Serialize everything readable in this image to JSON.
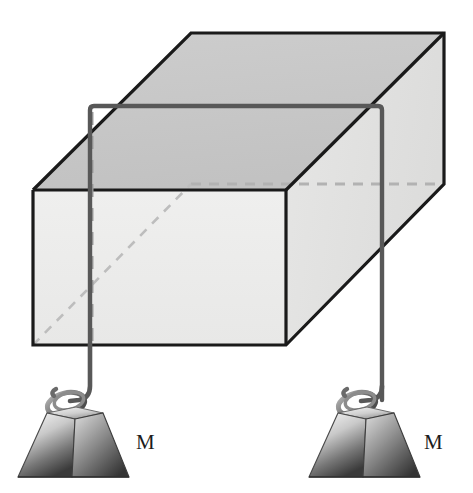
{
  "figure": {
    "type": "physics-free-body-diagram",
    "canvas": {
      "width": 473,
      "height": 493
    },
    "background_color": "#ffffff"
  },
  "labels": {
    "mass_left": "M",
    "mass_right": "M"
  },
  "colors": {
    "outline": "#1a1a1a",
    "top_face": "#c9c9c9",
    "front_face": "#ececeb",
    "side_face": "#e3e3e2",
    "hidden_edge": "#b0b0b0",
    "cord": "#5a5a5a",
    "weight_light": "#f2f2f2",
    "weight_dark": "#3a3a3a",
    "label_text": "#1c1c1c"
  },
  "geometry": {
    "box": {
      "front_face": [
        [
          33,
          190
        ],
        [
          286,
          190
        ],
        [
          286,
          345
        ],
        [
          33,
          345
        ]
      ],
      "back_face": [
        [
          191,
          33
        ],
        [
          444,
          33
        ],
        [
          444,
          184
        ],
        [
          191,
          184
        ]
      ],
      "depth_offset": [
        158,
        -157
      ]
    },
    "cord": {
      "left_vertical_x": 90,
      "right_vertical_x": 382,
      "horizontal_y": 106,
      "stroke_width": 4.2
    },
    "weights": [
      {
        "name": "mass-left",
        "center_x": 75,
        "top_y": 412,
        "bottom_y": 476
      },
      {
        "name": "mass-right",
        "center_x": 361,
        "top_y": 412,
        "bottom_y": 476
      }
    ],
    "hidden_edges": {
      "vertical_dashed_x": 91,
      "front_face_diagonal": [
        [
          33,
          345
        ],
        [
          191,
          184
        ]
      ],
      "back_bottom_horizontal": [
        [
          191,
          184
        ],
        [
          444,
          184
        ]
      ]
    }
  }
}
